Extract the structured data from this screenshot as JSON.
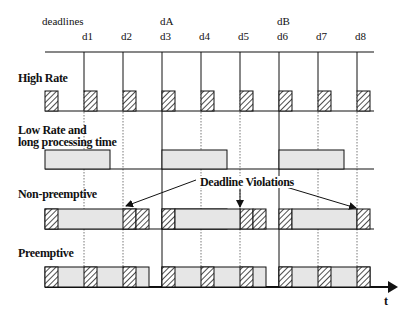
{
  "diagram": {
    "header_label": "deadlines",
    "deadline_labels": [
      {
        "name": "d1",
        "x": 88
      },
      {
        "name": "d2",
        "x": 127
      },
      {
        "name": "d3",
        "x": 166
      },
      {
        "name": "d4",
        "x": 205
      },
      {
        "name": "d5",
        "x": 244
      },
      {
        "name": "d6",
        "x": 283
      },
      {
        "name": "d7",
        "x": 322
      },
      {
        "name": "d8",
        "x": 361
      }
    ],
    "long_deadline_labels": [
      {
        "name": "dA",
        "x": 166
      },
      {
        "name": "dB",
        "x": 283
      }
    ],
    "rows": [
      {
        "label": "High Rate"
      },
      {
        "label_line1": "Low Rate and",
        "label_line2": "long processing time"
      },
      {
        "label": "Non-preemptive"
      },
      {
        "label": "Preemptive"
      }
    ],
    "annotation": "Deadline Violations",
    "time_axis_label": "t",
    "colors": {
      "line": "#111111",
      "fill": "#e6e6e6",
      "hatch": "#222222"
    }
  }
}
